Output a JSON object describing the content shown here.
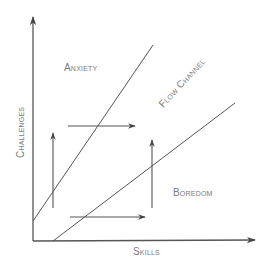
{
  "diagram": {
    "axes": {
      "x_label": "Skills",
      "y_label": "Challenges"
    },
    "regions": {
      "anxiety": "Anxiety",
      "flow_channel": "Flow Channel",
      "boredom": "Boredom"
    },
    "colors": {
      "line": "#555555",
      "text": "#7a7a7a",
      "background": "#ffffff"
    }
  }
}
